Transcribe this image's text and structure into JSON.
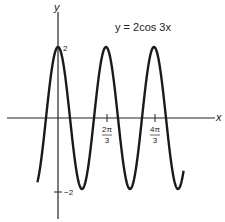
{
  "chart_data": {
    "type": "line",
    "title": "y = 2cos 3x",
    "function": "y = 2cos(3x)",
    "xlabel": "x",
    "ylabel": "y",
    "x_ticks": [
      {
        "value": 2.0944,
        "label_num": "2π",
        "label_den": "3"
      },
      {
        "value": 4.1888,
        "label_num": "4π",
        "label_den": "3"
      }
    ],
    "y_ticks": [
      {
        "value": 2,
        "label": "2"
      },
      {
        "value": -2,
        "label": "−2"
      }
    ],
    "amplitude": 2,
    "period": "2π/3",
    "x_range_plotted": [
      -0.9,
      5.48
    ],
    "ylim": [
      -2,
      2
    ],
    "grid": false,
    "line_color": "#1a1a1a"
  },
  "labels": {
    "equation": "y = 2cos 3x",
    "x_axis": "x",
    "y_axis": "y",
    "tick_2": "2",
    "tick_neg2": "−2",
    "tick_2pi_num": "2π",
    "tick_4pi_num": "4π",
    "tick_den": "3"
  }
}
